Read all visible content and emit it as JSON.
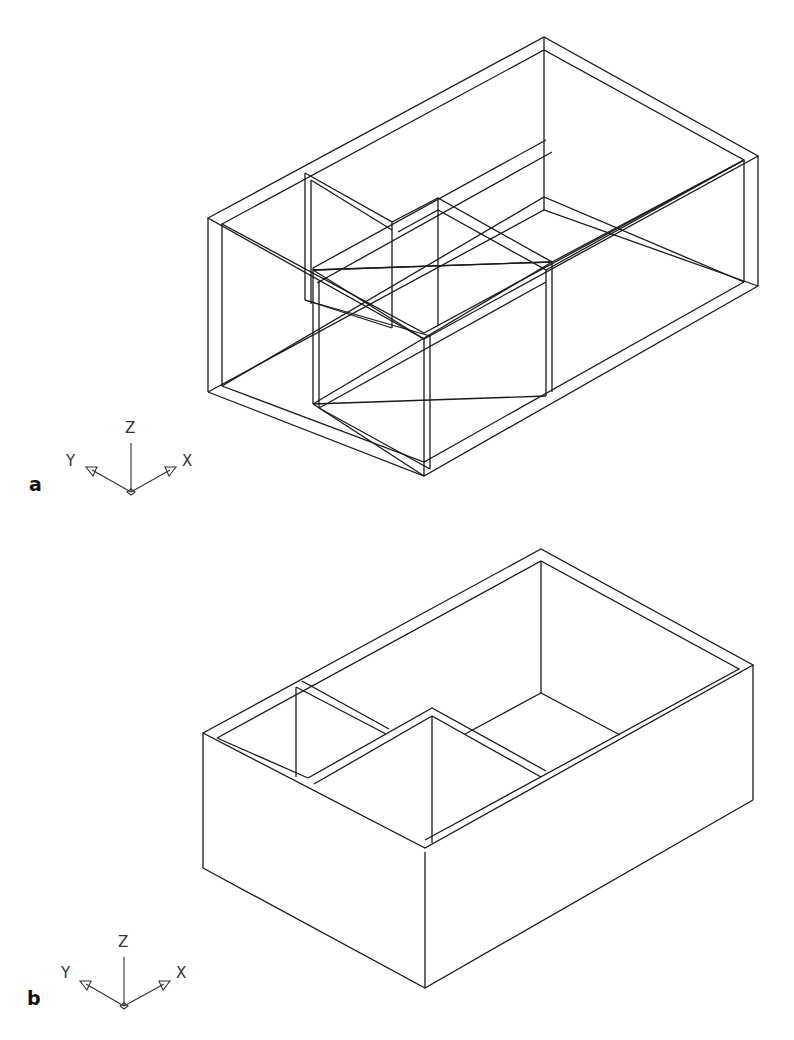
{
  "figure": {
    "panels": [
      {
        "id": "a",
        "label": "a",
        "view": "wireframe",
        "ucs": {
          "z": "Z",
          "y": "Y",
          "x": "X"
        }
      },
      {
        "id": "b",
        "label": "b",
        "view": "hidden-line removed",
        "ucs": {
          "z": "Z",
          "y": "Y",
          "x": "X"
        }
      }
    ]
  }
}
